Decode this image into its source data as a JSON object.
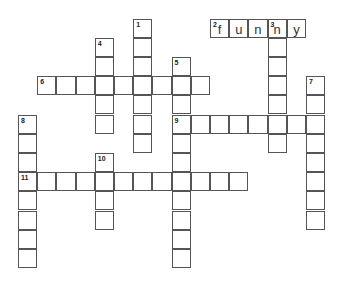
{
  "puzzle": {
    "cell_size": 19.2,
    "origin_x": 18,
    "origin_y": 18.5,
    "words": [
      {
        "number": "1",
        "direction": "down",
        "col": 6,
        "row": 0,
        "length": 7,
        "answer": ""
      },
      {
        "number": "2",
        "direction": "across",
        "col": 10,
        "row": 0,
        "length": 5,
        "answer": "funny"
      },
      {
        "number": "3",
        "direction": "down",
        "col": 13,
        "row": 0,
        "length": 7,
        "answer": "n"
      },
      {
        "number": "4",
        "direction": "down",
        "col": 4,
        "row": 1,
        "length": 5,
        "answer": ""
      },
      {
        "number": "5",
        "direction": "down",
        "col": 8,
        "row": 2,
        "length": 11,
        "answer": ""
      },
      {
        "number": "6",
        "direction": "across",
        "col": 1,
        "row": 3,
        "length": 9,
        "answer": ""
      },
      {
        "number": "7",
        "direction": "down",
        "col": 15,
        "row": 3,
        "length": 8,
        "answer": ""
      },
      {
        "number": "8",
        "direction": "down",
        "col": 0,
        "row": 5,
        "length": 8,
        "answer": ""
      },
      {
        "number": "9",
        "direction": "across",
        "col": 8,
        "row": 5,
        "length": 8,
        "answer": ""
      },
      {
        "number": "10",
        "direction": "down",
        "col": 4,
        "row": 7,
        "length": 4,
        "answer": ""
      },
      {
        "number": "11",
        "direction": "across",
        "col": 0,
        "row": 8,
        "length": 12,
        "answer": ""
      }
    ]
  }
}
